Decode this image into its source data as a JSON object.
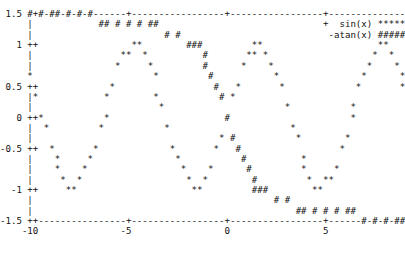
{
  "chart_data": {
    "type": "scatter",
    "renderer": "gnuplot-dumb-ascii",
    "title": "",
    "subtitle": "",
    "xlabel": "",
    "ylabel": "",
    "xlim": [
      -10,
      10
    ],
    "ylim": [
      -1.5,
      1.5
    ],
    "grid": false,
    "legend_position": "top-right",
    "x_ticks": [
      "-10",
      "-5",
      "0",
      "5",
      "10"
    ],
    "x_tick_values": [
      -10,
      -5,
      0,
      5,
      10
    ],
    "y_ticks": [
      "1.5",
      "1",
      "0.5",
      "0",
      "-0.5",
      "-1",
      "-1.5"
    ],
    "y_tick_values": [
      1.5,
      1,
      0.5,
      0,
      -0.5,
      -1,
      -1.5
    ],
    "border_chars": {
      "vertical": "|",
      "horizontal": "-",
      "tick": "+"
    },
    "series": [
      {
        "name": "sin(x)",
        "marker": "*",
        "legend_sample": "******",
        "legend_prefix": "+",
        "expression": "sin(x)",
        "x": [
          -10.0,
          -9.75,
          -9.5,
          -9.25,
          -9.0,
          -8.75,
          -8.5,
          -8.25,
          -8.0,
          -7.75,
          -7.5,
          -7.25,
          -7.0,
          -6.75,
          -6.5,
          -6.25,
          -6.0,
          -5.75,
          -5.5,
          -5.25,
          -5.0,
          -4.75,
          -4.5,
          -4.25,
          -4.0,
          -3.75,
          -3.5,
          -3.25,
          -3.0,
          -2.75,
          -2.5,
          -2.25,
          -2.0,
          -1.75,
          -1.5,
          -1.25,
          -1.0,
          -0.75,
          -0.5,
          -0.25,
          0.0,
          0.25,
          0.5,
          0.75,
          1.0,
          1.25,
          1.5,
          1.75,
          2.0,
          2.25,
          2.5,
          2.75,
          3.0,
          3.25,
          3.5,
          3.75,
          4.0,
          4.25,
          4.5,
          4.75,
          5.0,
          5.25,
          5.5,
          5.75,
          6.0,
          6.25,
          6.5,
          6.75,
          7.0,
          7.25,
          7.5,
          7.75,
          8.0,
          8.25,
          8.5,
          8.75,
          9.0,
          9.25,
          9.5,
          9.75,
          10.0
        ],
        "y": [
          0.544,
          0.353,
          0.075,
          -0.213,
          -0.412,
          -0.625,
          -0.798,
          -0.925,
          -0.989,
          -0.989,
          -0.938,
          -0.82,
          -0.657,
          -0.454,
          -0.215,
          0.034,
          0.279,
          0.503,
          0.706,
          0.861,
          0.959,
          0.999,
          0.978,
          0.895,
          0.757,
          0.572,
          0.351,
          0.108,
          -0.141,
          -0.382,
          -0.598,
          -0.778,
          -0.909,
          -0.984,
          -0.997,
          -0.949,
          -0.841,
          -0.682,
          -0.479,
          -0.247,
          0.0,
          0.247,
          0.479,
          0.682,
          0.841,
          0.949,
          0.997,
          0.984,
          0.909,
          0.778,
          0.598,
          0.382,
          0.141,
          -0.108,
          -0.351,
          -0.572,
          -0.757,
          -0.895,
          -0.978,
          -0.999,
          -0.959,
          -0.861,
          -0.706,
          -0.503,
          -0.279,
          -0.034,
          0.215,
          0.454,
          0.657,
          0.82,
          0.938,
          0.989,
          0.989,
          0.925,
          0.798,
          0.625,
          0.412,
          0.213,
          -0.075,
          -0.353,
          -0.544
        ]
      },
      {
        "name": "-atan(x)",
        "marker": "#",
        "legend_sample": "######",
        "legend_prefix": "",
        "expression": "-atan(x)",
        "x": [
          -10.0,
          -9.5,
          -9.0,
          -8.5,
          -8.0,
          -7.5,
          -7.0,
          -6.5,
          -6.0,
          -5.5,
          -5.0,
          -4.5,
          -4.0,
          -3.5,
          -3.0,
          -2.5,
          -2.0,
          -1.75,
          -1.5,
          -1.25,
          -1.0,
          -0.75,
          -0.5,
          -0.25,
          0.0,
          0.25,
          0.5,
          0.75,
          1.0,
          1.25,
          1.5,
          1.75,
          2.0,
          2.5,
          3.0,
          3.5,
          4.0,
          4.5,
          5.0,
          5.5,
          6.0,
          6.5,
          7.0,
          7.5,
          8.0,
          8.5,
          9.0,
          9.5,
          10.0
        ],
        "y": [
          1.471,
          1.466,
          1.46,
          1.454,
          1.446,
          1.438,
          1.429,
          1.418,
          1.406,
          1.391,
          1.373,
          1.352,
          1.326,
          1.292,
          1.249,
          1.19,
          1.107,
          1.052,
          0.983,
          0.896,
          0.785,
          0.644,
          0.464,
          0.245,
          0.0,
          -0.245,
          -0.464,
          -0.644,
          -0.785,
          -0.896,
          -0.983,
          -1.052,
          -1.107,
          -1.19,
          -1.249,
          -1.292,
          -1.326,
          -1.352,
          -1.373,
          -1.391,
          -1.406,
          -1.418,
          -1.429,
          -1.438,
          -1.446,
          -1.454,
          -1.46,
          -1.466,
          -1.471
        ]
      }
    ]
  },
  "legend": {
    "entries": [
      {
        "label": "sin(x)",
        "prefix_marker": "+",
        "sample": "******",
        "suffix_marker": "+"
      },
      {
        "label": "-atan(x)",
        "prefix_marker": "",
        "sample": "######",
        "suffix_marker": "|"
      }
    ]
  },
  "plot_ascii": " 1.5 ##############-------+-------------------+-------------------+------------++\n     +          ##############                  +                             +\n     |                      #####                          -atan(x) ###### |\n   1 ++                **        ###                  **                ** ++\n     |              *****         ##                ****              ***** |\n     |            *       *       ##              *      *           *     *|\n     +           *         *      ##             *        *         *       +\n 0.5 *+         *           *     #             *          *       *       ++\n     |*        *             *    #*           *            *     *         |\n     |**      *               *   #**         *              *   *         **\n   0 ++*     *                 *  #  *       *                * *         *++\n     | **   *                   ** #   **   *                  **        ** |\n     |   * *                      *#     * *                    *        *  |\n-0.5 ++   *                        #      *                      *      *  +*\n     |     *                      ##       *                      *    *    *\n     |      *                    ##         *                      *  *     |\n     |       ****              ###           ****                   **      |\n  -1 ++         **            ###              **                        ++\n     |                      #####                                          |\n     +          +           ############          +                        +\n-1.5 ++---------+----------------------+##############--------------+######++\n     -10        -5                     0                5                 10",
  "markers": {
    "sin_marker": "*",
    "atan_marker": "#",
    "tick_marker": "+",
    "vertical_border": "|",
    "horizontal_border": "-"
  },
  "style": {
    "background": "#ffffff",
    "foreground": "#111111"
  }
}
